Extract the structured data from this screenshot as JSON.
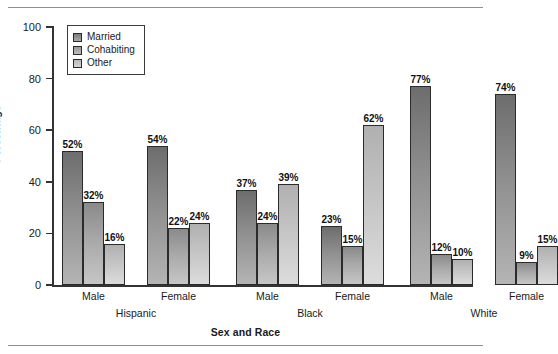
{
  "chart_data": {
    "type": "bar",
    "title": "",
    "xlabel": "Sex and Race",
    "ylabel": "Percentage",
    "ylim": [
      0,
      100
    ],
    "yticks": [
      0,
      20,
      40,
      60,
      80,
      100
    ],
    "ytick_labels": [
      "0",
      "20",
      "40",
      "60",
      "80",
      "100"
    ],
    "grid": false,
    "legend_position": "upper left",
    "value_suffix": "%",
    "categories": [
      "Male",
      "Female",
      "Male",
      "Female",
      "Male",
      "Female"
    ],
    "group_labels": [
      "Hispanic",
      "Black",
      "White"
    ],
    "groups": [
      {
        "race": "Hispanic",
        "bars": [
          {
            "sex": "Male",
            "values": [
              52,
              32,
              16
            ],
            "labels": [
              "52%",
              "32%",
              "16%"
            ]
          },
          {
            "sex": "Female",
            "values": [
              54,
              22,
              24
            ],
            "labels": [
              "54%",
              "22%",
              "24%"
            ]
          }
        ]
      },
      {
        "race": "Black",
        "bars": [
          {
            "sex": "Male",
            "values": [
              37,
              24,
              39
            ],
            "labels": [
              "37%",
              "24%",
              "39%"
            ]
          },
          {
            "sex": "Female",
            "values": [
              23,
              15,
              62
            ],
            "labels": [
              "23%",
              "15%",
              "62%"
            ]
          }
        ]
      },
      {
        "race": "White",
        "bars": [
          {
            "sex": "Male",
            "values": [
              77,
              12,
              10
            ],
            "labels": [
              "77%",
              "12%",
              "10%"
            ]
          },
          {
            "sex": "Female",
            "values": [
              74,
              9,
              15
            ],
            "labels": [
              "74%",
              "9%",
              "15%"
            ]
          }
        ]
      }
    ],
    "series": [
      {
        "name": "Married",
        "color": "#8f8f8f",
        "values": [
          52,
          54,
          37,
          23,
          77,
          74
        ]
      },
      {
        "name": "Cohabiting",
        "color": "#a8a8a8",
        "values": [
          32,
          22,
          24,
          15,
          12,
          9
        ]
      },
      {
        "name": "Other",
        "color": "#c4c4c4",
        "values": [
          16,
          24,
          39,
          62,
          10,
          15
        ]
      }
    ],
    "legend": [
      {
        "label": "Married",
        "color": "#8f8f8f"
      },
      {
        "label": "Cohabiting",
        "color": "#a8a8a8"
      },
      {
        "label": "Other",
        "color": "#c4c4c4"
      }
    ]
  }
}
